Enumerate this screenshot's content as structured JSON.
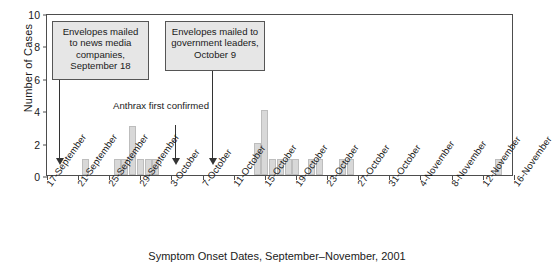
{
  "figure": {
    "caption": "Symptom Onset Dates, September–November, 2001",
    "y_axis_title": "Number of Cases"
  },
  "annotations": [
    {
      "id": "media-envelopes",
      "text": "Envelopes mailed to news media companies, September 18",
      "boxed": true
    },
    {
      "id": "anthrax-confirmed",
      "text": "Anthrax first confirmed",
      "boxed": false
    },
    {
      "id": "government-envelopes",
      "text": "Envelopes mailed to government leaders, October 9",
      "boxed": true
    }
  ],
  "chart_data": {
    "type": "bar",
    "title": "",
    "xlabel": "Symptom Onset Dates, September–November, 2001",
    "ylabel": "Number of Cases",
    "ylim": [
      0,
      10
    ],
    "yticks": [
      0,
      2,
      4,
      6,
      8,
      10
    ],
    "grid": false,
    "legend": "none",
    "xtick_labels": [
      "17-September",
      "21-September",
      "25-September",
      "29-September",
      "3-October",
      "7-October",
      "11-October",
      "15-October",
      "19-October",
      "23-October",
      "27-October",
      "31-October",
      "4-November",
      "8-November",
      "12-November",
      "16-November"
    ],
    "xtick_days": [
      0,
      4,
      8,
      12,
      16,
      20,
      24,
      28,
      32,
      36,
      40,
      44,
      48,
      52,
      56,
      60
    ],
    "x_start_date": "17-September",
    "x_end_date": "18-November",
    "categories": [
      "22-September",
      "26-September",
      "27-September",
      "28-September",
      "29-September",
      "30-September",
      "1-October",
      "14-October",
      "15-October",
      "16-October",
      "17-October",
      "18-October",
      "19-October",
      "21-October",
      "22-October",
      "25-October",
      "26-October",
      "14-November"
    ],
    "values": [
      1,
      1,
      1,
      3,
      1,
      1,
      1,
      2,
      4,
      1,
      1,
      1,
      1,
      1,
      1,
      1,
      1,
      1
    ],
    "annotations_on_axis": [
      {
        "label": "Envelopes mailed to news media companies, September 18",
        "date": "18-September"
      },
      {
        "label": "Anthrax first confirmed",
        "date": "4-October"
      },
      {
        "label": "Envelopes mailed to government leaders, October 9",
        "date": "9-October"
      }
    ]
  },
  "colors": {
    "bar_fill": "#d8d8d8",
    "bar_stroke": "#bdbdbd",
    "axis": "#4d4d4d",
    "note_fill": "#e6e6e6",
    "note_stroke": "#555555",
    "text": "#1a1a1a"
  }
}
